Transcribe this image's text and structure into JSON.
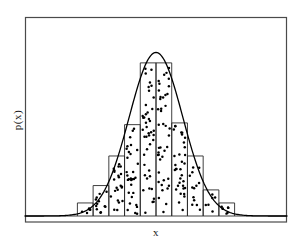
{
  "figure": {
    "background_color": "#ffffff",
    "frame_color": "#3c3c3c",
    "ink_color": "#000000"
  },
  "axes": {
    "xlabel": "x",
    "ylabel": "p(x)",
    "xticks": [],
    "yticks": [],
    "grid": false,
    "frame": {
      "x0": 25,
      "y0": 17,
      "x1": 287,
      "y1": 222
    }
  },
  "chart_data": {
    "type": "bar",
    "title": "",
    "xlabel": "x",
    "ylabel": "p(x)",
    "grid": false,
    "legend": null,
    "xlim": [
      -5.0,
      5.0
    ],
    "ylim": [
      0.0,
      1.0
    ],
    "bin_edges": [
      -3.0,
      -2.4,
      -1.8,
      -1.2,
      -0.6,
      0.0,
      0.6,
      1.2,
      1.8,
      2.4,
      3.0
    ],
    "categories": [
      "-2.7",
      "-2.1",
      "-1.5",
      "-0.9",
      "-0.3",
      "0.3",
      "0.9",
      "1.5",
      "2.1",
      "2.7"
    ],
    "values": [
      0.075,
      0.175,
      0.345,
      0.525,
      0.88,
      0.88,
      0.535,
      0.345,
      0.15,
      0.075
    ],
    "series": [
      {
        "name": "histogram",
        "type": "bar",
        "values": [
          0.075,
          0.175,
          0.345,
          0.525,
          0.88,
          0.88,
          0.535,
          0.345,
          0.15,
          0.075
        ]
      },
      {
        "name": "gaussian-density-curve",
        "type": "line",
        "x": [
          -5.0,
          -4.6,
          -4.2,
          -3.8,
          -3.4,
          -3.0,
          -2.6,
          -2.2,
          -1.8,
          -1.4,
          -1.0,
          -0.6,
          -0.2,
          0.0,
          0.2,
          0.6,
          1.0,
          1.4,
          1.8,
          2.2,
          2.6,
          3.0,
          3.4,
          3.8,
          4.2,
          4.6,
          5.0
        ],
        "y": [
          0.002,
          0.004,
          0.008,
          0.015,
          0.028,
          0.05,
          0.09,
          0.155,
          0.25,
          0.385,
          0.545,
          0.715,
          0.865,
          0.94,
          0.865,
          0.715,
          0.545,
          0.385,
          0.25,
          0.155,
          0.09,
          0.05,
          0.028,
          0.015,
          0.008,
          0.004,
          0.002
        ]
      },
      {
        "name": "sample-scatter-points",
        "type": "scatter",
        "count": 214,
        "marker": "dot",
        "marker_size": 2
      }
    ]
  }
}
